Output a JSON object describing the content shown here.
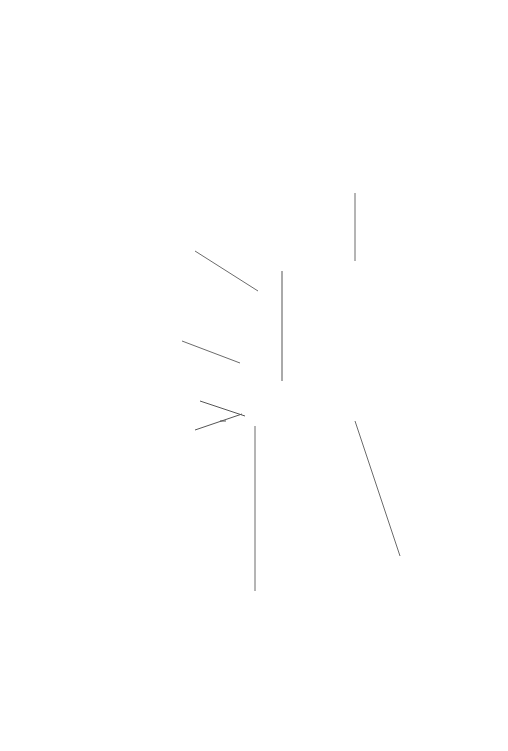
{
  "badge": {
    "center_text": "AI Powered Pedagogy",
    "outer_label_ai": "5 AI PRINCIPLES",
    "outer_label_pedagogical": "6 PEDAGOGICAL PRINCIPLES",
    "colors": {
      "dark_ring": "#1f1f1f",
      "light_ring": "#eeeeee",
      "center": "#3d3d3d"
    }
  },
  "hub": {
    "number": "6",
    "title_line1": "Pedagogical",
    "title_line2": "Principles",
    "ring_color": "#1e1e1e"
  },
  "principles": [
    {
      "title": "Evidence Learning",
      "description": "Both qualitative and quantitated data is collected continuously to evidence learning which is used to inform teaching and provide feedback to learners.",
      "icon": "book-gear-icon"
    },
    {
      "title": "Learner-centered & Learner-driven",
      "description": "Learners are at the core of the learning cycle, with instruction tailored to students' motivations, enhancing engagement by empowering them to shape their own learning experiences.",
      "icon": "learner-person-icon"
    },
    {
      "title": "Inquiry-Based Learning",
      "description": "Encourages students to learn by asking questions, exploring, and investigating, fostering a deeper understanding through curiosity-driven education.",
      "icon": "question-mark-icon"
    },
    {
      "title": "Collaborative",
      "description": "Learners are immersed in a social constructivist environment where prior knowledge is used as a springboard.",
      "icon": "group-collaboration-icon"
    },
    {
      "title": "Concept-Based Learning",
      "description": "Teaching and learning is focused on helping learners to build foundational facts and skills as a gateway to develop conceptual understanding. This allows learners to apply and transfer to dissimilar and unfamiliar situations.",
      "icon": "lightbulb-icon"
    },
    {
      "title": "Inclusive & Equitable",
      "description": "Design and planning account for the needs of neurodiverse learners and those from diverse backgrounds, ensuring equitable access for all.",
      "icon": "handshake-icon"
    }
  ]
}
